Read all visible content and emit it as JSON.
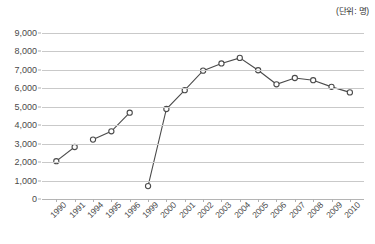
{
  "unit_note": "(단위: 명)",
  "chart_data": {
    "type": "line",
    "title": "",
    "subtitle": "",
    "xlabel": "",
    "ylabel": "",
    "unit_label": "(단위: 명)",
    "ylim": [
      0,
      9000
    ],
    "ytick_values": [
      9000,
      8000,
      7000,
      6000,
      5000,
      4000,
      3000,
      2000,
      1000,
      0
    ],
    "ytick_labels": [
      "9,000",
      "8,000",
      "7,000",
      "6,000",
      "5,000",
      "4,000",
      "3,000",
      "2,000",
      "1,000",
      "0"
    ],
    "grid": true,
    "legend": false,
    "legend_position": "none",
    "marker": "open-circle",
    "line_color": "#4b4b4b",
    "grid_color": "#c9c9c9",
    "categories": [
      "1990",
      "1991",
      "1994",
      "1995",
      "1996",
      "1999",
      "2000",
      "2001",
      "2002",
      "2003",
      "2004",
      "2005",
      "2006",
      "2007",
      "2008",
      "2009",
      "2010"
    ],
    "values": [
      2050,
      2820,
      3220,
      3670,
      4680,
      700,
      4880,
      5900,
      6960,
      7350,
      7650,
      6980,
      6220,
      6560,
      6440,
      6080,
      5780
    ],
    "segments": [
      {
        "categories": [
          "1990",
          "1991"
        ],
        "values": [
          2050,
          2820
        ]
      },
      {
        "categories": [
          "1994",
          "1995",
          "1996"
        ],
        "values": [
          3220,
          3670,
          4680
        ]
      },
      {
        "categories": [
          "1999",
          "2000",
          "2001",
          "2002",
          "2003",
          "2004",
          "2005",
          "2006",
          "2007",
          "2008",
          "2009",
          "2010"
        ],
        "values": [
          700,
          4880,
          5900,
          6960,
          7350,
          7650,
          6980,
          6220,
          6560,
          6440,
          6080,
          5780
        ]
      }
    ],
    "missing_categories": [
      "1992",
      "1993",
      "1997",
      "1998"
    ]
  }
}
